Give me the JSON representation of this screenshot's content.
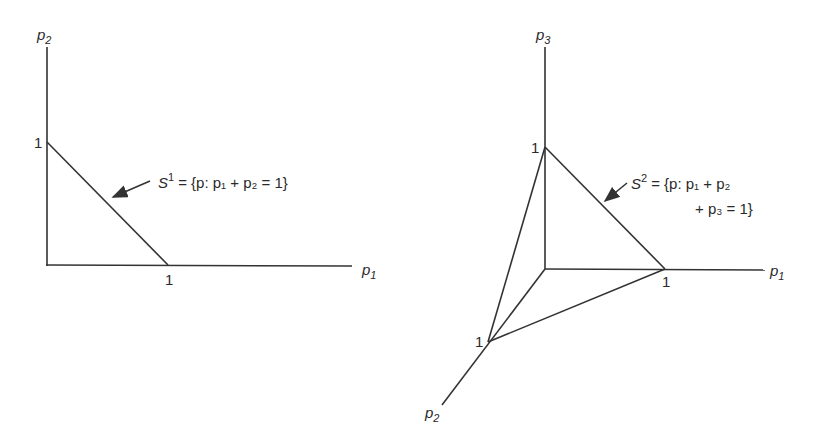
{
  "left_diagram": {
    "y_axis_label": {
      "base": "p",
      "sub": "2"
    },
    "x_axis_label": {
      "base": "p",
      "sub": "1"
    },
    "y_tick": "1",
    "x_tick": "1",
    "set_label": {
      "name": "S",
      "sup": "1",
      "equation": "= {p: p₁ + p₂ = 1}"
    }
  },
  "right_diagram": {
    "z_axis_label": {
      "base": "p",
      "sub": "3"
    },
    "x_axis_label": {
      "base": "p",
      "sub": "1"
    },
    "y_axis_label": {
      "base": "p",
      "sub": "2"
    },
    "z_tick": "1",
    "x_tick": "1",
    "y_tick": "1",
    "set_label": {
      "name": "S",
      "sup": "2",
      "equation_line1": "= {p: p₁ + p₂",
      "equation_line2": "+ p₃ = 1}"
    }
  },
  "colors": {
    "line": "#333333",
    "text": "#2a2a2a",
    "background": "#ffffff"
  }
}
